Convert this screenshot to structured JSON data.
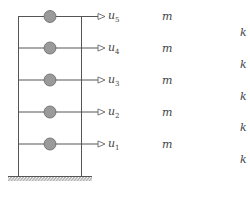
{
  "diagram": {
    "colors": {
      "line": "#555555",
      "mass_fill": "#9a9a9a",
      "mass_stroke": "#666666"
    },
    "floors": [
      {
        "id": 5,
        "disp_base": "u",
        "disp_sub": "5",
        "mass": "m",
        "stiffness": "k"
      },
      {
        "id": 4,
        "disp_base": "u",
        "disp_sub": "4",
        "mass": "m",
        "stiffness": "k"
      },
      {
        "id": 3,
        "disp_base": "u",
        "disp_sub": "3",
        "mass": "m",
        "stiffness": "k"
      },
      {
        "id": 2,
        "disp_base": "u",
        "disp_sub": "2",
        "mass": "m",
        "stiffness": "k"
      },
      {
        "id": 1,
        "disp_base": "u",
        "disp_sub": "1",
        "mass": "m",
        "stiffness": "k"
      }
    ],
    "ground": "fixed base"
  }
}
